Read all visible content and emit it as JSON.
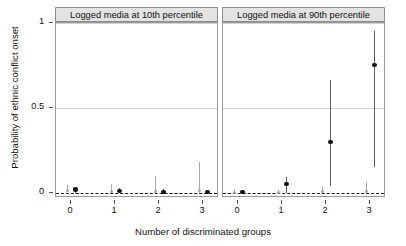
{
  "chart_data": {
    "type": "scatter",
    "title": "",
    "xlabel": "Number of discriminated groups",
    "ylabel": "Probability of ethnic conflict onset",
    "ylim": [
      -0.06,
      1.06
    ],
    "yticks": [
      0,
      0.5,
      1
    ],
    "ytick_labels": [
      "0",
      "0.5",
      "1"
    ],
    "xticks": [
      0,
      1,
      2,
      3
    ],
    "xtick_labels": [
      "0",
      "1",
      "2",
      "3"
    ],
    "grid": "horizontal gridlines at 0.5 and 1; dashed reference line at 0",
    "legend": "none",
    "panels": [
      {
        "label": "Logged media at 10th percentile",
        "series": [
          {
            "name": "grey",
            "color": "#a8a8a8",
            "x": [
              0,
              1,
              2,
              3
            ],
            "values": [
              0.012,
              0.009,
              0.008,
              0.012
            ],
            "ci_low": [
              0.0,
              0.0,
              0.0,
              0.0
            ],
            "ci_high": [
              0.045,
              0.055,
              0.1,
              0.185
            ]
          },
          {
            "name": "black",
            "color": "#111111",
            "x": [
              0,
              1,
              2,
              3
            ],
            "values": [
              0.021,
              0.012,
              0.006,
              0.004
            ],
            "ci_low": [
              0.0,
              0.0,
              0.0,
              0.0
            ],
            "ci_high": [
              0.035,
              0.028,
              0.022,
              0.02
            ]
          }
        ]
      },
      {
        "label": "Logged media at 90th percentile",
        "series": [
          {
            "name": "grey",
            "color": "#a8a8a8",
            "x": [
              0,
              1,
              2,
              3
            ],
            "values": [
              0.004,
              0.005,
              0.006,
              0.007
            ],
            "ci_low": [
              0.0,
              0.0,
              0.0,
              0.0
            ],
            "ci_high": [
              0.022,
              0.018,
              0.035,
              0.065
            ]
          },
          {
            "name": "black",
            "color": "#111111",
            "x": [
              0,
              1,
              2,
              3
            ],
            "values": [
              0.006,
              0.052,
              0.3,
              0.755
            ],
            "ci_low": [
              0.0,
              0.0,
              0.042,
              0.155
            ],
            "ci_high": [
              0.02,
              0.095,
              0.665,
              0.955
            ]
          }
        ]
      }
    ]
  },
  "axes": {
    "ylabel": "Probability of ethnic conflict onset",
    "xlabel": "Number of discriminated groups",
    "ytick_labels": [
      "1",
      "0.5",
      "0"
    ],
    "xtick_labels": [
      "0",
      "1",
      "2",
      "3"
    ]
  },
  "panels": {
    "left_title": "Logged media at 10th percentile",
    "right_title": "Logged media at 90th percentile"
  }
}
